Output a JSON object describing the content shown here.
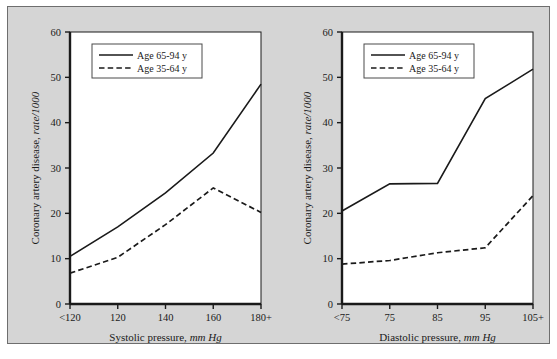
{
  "figure": {
    "background_color": "#d5d5d5",
    "border_color": "#6e6e6e",
    "plot_background": "#ffffff",
    "line_color": "#1a1a1a"
  },
  "legend": {
    "series_1_label": "Age 65-94 y",
    "series_2_label": "Age 35-64 y"
  },
  "chart_data": [
    {
      "type": "line",
      "panel": "left",
      "title": "",
      "xlabel": "Systolic pressure, mm Hg",
      "xlabel_plain": "Systolic pressure,",
      "xlabel_italic": "mm Hg",
      "ylabel": "Coronary artery disease, rate/1000",
      "ylabel_plain": "Coronary artery disease,",
      "ylabel_italic": "rate/1000",
      "categories": [
        "<120",
        "120",
        "140",
        "160",
        "180+"
      ],
      "xticklabels": [
        "<120",
        "120",
        "140",
        "160",
        "180+"
      ],
      "yticklabels": [
        "0",
        "10",
        "20",
        "30",
        "40",
        "50",
        "60"
      ],
      "yticks": [
        0,
        10,
        20,
        30,
        40,
        50,
        60
      ],
      "ylim": [
        0,
        60
      ],
      "grid": false,
      "legend_position": "upper-left",
      "series": [
        {
          "name": "Age 65-94 y",
          "style": "solid",
          "values": [
            10.5,
            17.0,
            24.5,
            33.3,
            48.5
          ]
        },
        {
          "name": "Age 35-64 y",
          "style": "dashed",
          "values": [
            6.8,
            10.3,
            17.5,
            25.6,
            20.2
          ]
        }
      ]
    },
    {
      "type": "line",
      "panel": "right",
      "title": "",
      "xlabel": "Diastolic pressure, mm Hg",
      "xlabel_plain": "Diastolic pressure,",
      "xlabel_italic": "mm Hg",
      "ylabel": "Coronary artery disease, rate/1000",
      "ylabel_plain": "Coronary artery disease,",
      "ylabel_italic": "rate/1000",
      "categories": [
        "<75",
        "75",
        "85",
        "95",
        "105+"
      ],
      "xticklabels": [
        "<75",
        "75",
        "85",
        "95",
        "105+"
      ],
      "yticklabels": [
        "0",
        "10",
        "20",
        "30",
        "40",
        "50",
        "60"
      ],
      "yticks": [
        0,
        10,
        20,
        30,
        40,
        50,
        60
      ],
      "ylim": [
        0,
        60
      ],
      "grid": false,
      "legend_position": "upper-left",
      "series": [
        {
          "name": "Age 65-94 y",
          "style": "solid",
          "values": [
            20.5,
            26.5,
            26.6,
            45.3,
            51.8
          ]
        },
        {
          "name": "Age 35-64 y",
          "style": "dashed",
          "values": [
            8.8,
            9.6,
            11.3,
            12.4,
            23.9
          ]
        }
      ]
    }
  ]
}
